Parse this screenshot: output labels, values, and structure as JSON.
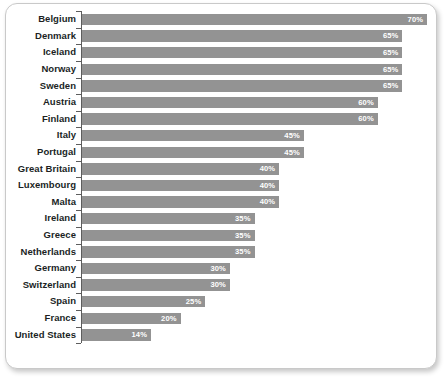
{
  "chart_data": {
    "type": "bar",
    "orientation": "horizontal",
    "title": "",
    "subtitle": "",
    "xlabel": "",
    "ylabel": "",
    "grid": false,
    "legend": null,
    "legend_position": "none",
    "xlim": [
      0,
      70
    ],
    "value_suffix": "%",
    "bar_color": "#939393",
    "value_label_color": "#ffffff",
    "category_label_color": "#201f1f",
    "axis_color": "#5d5d5d",
    "categories": [
      "Belgium",
      "Denmark",
      "Iceland",
      "Norway",
      "Sweden",
      "Austria",
      "Finland",
      "Italy",
      "Portugal",
      "Great Britain",
      "Luxembourg",
      "Malta",
      "Ireland",
      "Greece",
      "Netherlands",
      "Germany",
      "Switzerland",
      "Spain",
      "France",
      "United States"
    ],
    "values": [
      70,
      65,
      65,
      65,
      65,
      60,
      60,
      45,
      45,
      40,
      40,
      40,
      35,
      35,
      35,
      30,
      30,
      25,
      20,
      14
    ],
    "value_labels": [
      "70%",
      "65%",
      "65%",
      "65%",
      "65%",
      "60%",
      "60%",
      "45%",
      "45%",
      "40%",
      "40%",
      "40%",
      "35%",
      "35%",
      "35%",
      "30%",
      "30%",
      "25%",
      "20%",
      "14%"
    ]
  }
}
